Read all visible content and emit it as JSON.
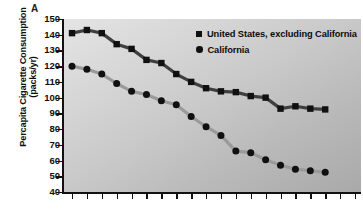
{
  "panel": {
    "letter": "A"
  },
  "axis": {
    "ylabel_line1": "Percapita Cigarette Consumption",
    "ylabel_line2": "(packs/yr)",
    "ytick_labels": [
      "150",
      "140",
      "130",
      "120",
      "110",
      "100",
      "90",
      "80",
      "70",
      "60",
      "50",
      "40"
    ]
  },
  "legend": {
    "items": [
      {
        "label": "United States, excluding California",
        "marker": "square",
        "color": "#101010"
      },
      {
        "label": "California",
        "marker": "circle",
        "color": "#101010"
      }
    ]
  },
  "colors": {
    "us_line": "#3f3f3f",
    "ca_line": "#9a9a9a",
    "marker": "#101010",
    "axis": "#111111",
    "plot_bg_light": "#e4e4e4",
    "plot_bg_dark": "#a9a9a9"
  },
  "chart_data": {
    "type": "line",
    "title": "",
    "xlabel": "",
    "ylabel": "Percapita Cigarette Consumption (packs/yr)",
    "ylim": [
      40,
      150
    ],
    "ytick_values": [
      150,
      140,
      130,
      120,
      110,
      100,
      90,
      80,
      70,
      60,
      50,
      40
    ],
    "grid": false,
    "legend_position": "top-right",
    "x": [
      1,
      2,
      3,
      4,
      5,
      6,
      7,
      8,
      9,
      10,
      11,
      12,
      13,
      14,
      15,
      16,
      17,
      18,
      19,
      20
    ],
    "x_tick_count": 20,
    "x_tick_labels": [],
    "series": [
      {
        "name": "United States, excluding California",
        "marker": "square",
        "values": [
          141,
          143,
          141,
          134,
          131,
          124,
          122,
          115,
          110,
          106,
          104,
          103.5,
          101,
          100,
          93,
          94.5,
          93,
          92.5,
          null,
          null
        ]
      },
      {
        "name": "California",
        "marker": "circle",
        "values": [
          120,
          118,
          115,
          109,
          104,
          102,
          98,
          95.5,
          88,
          81.5,
          76,
          66,
          65,
          60.5,
          57,
          54.5,
          53.5,
          52.5,
          null,
          null
        ]
      }
    ]
  }
}
